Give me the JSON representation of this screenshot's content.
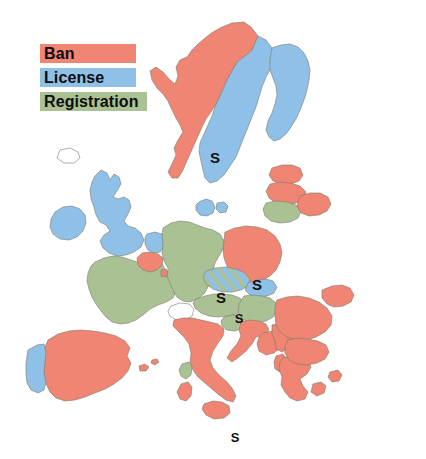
{
  "map": {
    "title": "Europe firearms regulation map",
    "background_color": "#ffffff",
    "border_color": "#7a7a6a",
    "categories": [
      {
        "id": "ban",
        "label": "Ban",
        "color": "#f08573"
      },
      {
        "id": "license",
        "label": "License",
        "color": "#8fc0e8"
      },
      {
        "id": "registration",
        "label": "Registration",
        "color": "#aac293"
      }
    ],
    "stripe_note": "hatched = license/registration mix",
    "marker_label": "S",
    "markers": [
      {
        "name": "marker-sweden",
        "label": "S",
        "x": 215,
        "y": 163
      },
      {
        "name": "marker-austria",
        "label": "S",
        "x": 221,
        "y": 303
      },
      {
        "name": "marker-slovakia",
        "label": "S",
        "x": 257,
        "y": 290
      },
      {
        "name": "marker-slovenia",
        "label": "S",
        "x": 239,
        "y": 323
      },
      {
        "name": "marker-malta",
        "label": "S",
        "x": 235,
        "y": 442
      }
    ],
    "countries": [
      {
        "name": "norway",
        "category": "ban"
      },
      {
        "name": "sweden",
        "category": "license"
      },
      {
        "name": "finland",
        "category": "license"
      },
      {
        "name": "denmark",
        "category": "license"
      },
      {
        "name": "united-kingdom",
        "category": "license"
      },
      {
        "name": "ireland",
        "category": "license"
      },
      {
        "name": "netherlands",
        "category": "license"
      },
      {
        "name": "belgium",
        "category": "ban"
      },
      {
        "name": "luxembourg",
        "category": "ban"
      },
      {
        "name": "france",
        "category": "registration"
      },
      {
        "name": "spain",
        "category": "ban"
      },
      {
        "name": "portugal",
        "category": "license"
      },
      {
        "name": "germany",
        "category": "registration"
      },
      {
        "name": "poland",
        "category": "ban"
      },
      {
        "name": "czech-republic",
        "category": "striped"
      },
      {
        "name": "slovakia",
        "category": "license"
      },
      {
        "name": "austria",
        "category": "registration"
      },
      {
        "name": "hungary",
        "category": "registration"
      },
      {
        "name": "slovenia",
        "category": "registration"
      },
      {
        "name": "croatia",
        "category": "ban"
      },
      {
        "name": "italy",
        "category": "ban"
      },
      {
        "name": "corsica",
        "category": "registration"
      },
      {
        "name": "sardinia",
        "category": "ban"
      },
      {
        "name": "sicily",
        "category": "ban"
      },
      {
        "name": "greece",
        "category": "ban"
      },
      {
        "name": "romania",
        "category": "ban"
      },
      {
        "name": "bulgaria",
        "category": "ban"
      },
      {
        "name": "serbia",
        "category": "ban"
      },
      {
        "name": "bosnia",
        "category": "ban"
      },
      {
        "name": "albania",
        "category": "ban"
      },
      {
        "name": "estonia",
        "category": "ban"
      },
      {
        "name": "latvia",
        "category": "ban"
      },
      {
        "name": "lithuania",
        "category": "registration"
      },
      {
        "name": "switzerland",
        "category": "none"
      },
      {
        "name": "iceland",
        "category": "none"
      }
    ]
  },
  "legend": {
    "ban_label": "Ban",
    "license_label": "License",
    "registration_label": "Registration"
  }
}
